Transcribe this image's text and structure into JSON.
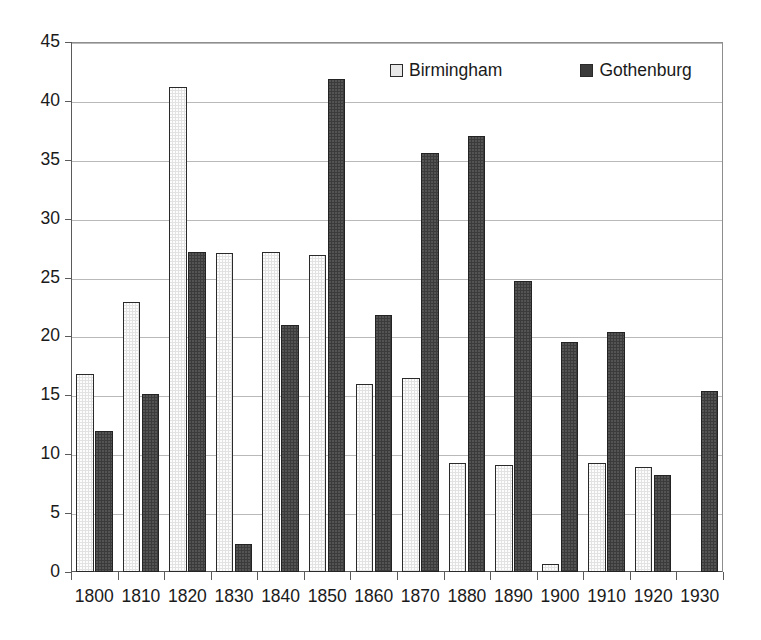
{
  "chart_data": {
    "type": "bar",
    "title": "",
    "subtitle": "",
    "xlabel": "",
    "ylabel": "",
    "categories": [
      "1800",
      "1810",
      "1820",
      "1830",
      "1840",
      "1850",
      "1860",
      "1870",
      "1880",
      "1890",
      "1900",
      "1910",
      "1920",
      "1930"
    ],
    "series": [
      {
        "name": "Birmingham",
        "color": "#e2e2e2",
        "values": [
          16.8,
          22.9,
          41.2,
          27.1,
          27.2,
          26.9,
          16.0,
          16.5,
          9.3,
          9.1,
          0.7,
          9.3,
          8.9,
          null
        ]
      },
      {
        "name": "Gothenburg",
        "color": "#3b3b3b",
        "values": [
          12.0,
          15.1,
          27.2,
          2.4,
          21.0,
          41.9,
          21.8,
          35.6,
          37.0,
          24.7,
          19.5,
          20.4,
          8.2,
          15.4
        ]
      }
    ],
    "ylim": [
      0,
      45
    ],
    "ytick_step": 5,
    "yticks": [
      "0",
      "5",
      "10",
      "15",
      "20",
      "25",
      "30",
      "35",
      "40",
      "45"
    ],
    "grid": true,
    "grid_axis": "y",
    "legend_position": "top-center",
    "legend": [
      {
        "label": "Birmingham",
        "swatch": "light-hatched-square"
      },
      {
        "label": "Gothenburg",
        "swatch": "dark-filled-square"
      }
    ]
  },
  "axes": {
    "y_axis_name": "y-axis",
    "x_axis_name": "x-axis"
  }
}
